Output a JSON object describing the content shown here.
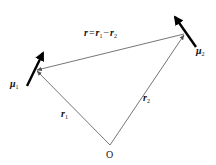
{
  "diagram": {
    "origin": {
      "label": "O",
      "x": 110,
      "y": 145
    },
    "points": {
      "dipole1": {
        "x": 36,
        "y": 70
      },
      "dipole2": {
        "x": 185,
        "y": 33
      }
    },
    "vectors": [
      {
        "id": "r1",
        "label": "r",
        "subscript": "1",
        "from": "O",
        "to": "dipole1"
      },
      {
        "id": "r2",
        "label": "r",
        "subscript": "2",
        "from": "O",
        "to": "dipole2"
      },
      {
        "id": "r",
        "label": "r",
        "from": "dipole2",
        "to": "dipole1"
      }
    ],
    "dipoles": [
      {
        "id": "mu1",
        "label": "μ",
        "subscript": "1"
      },
      {
        "id": "mu2",
        "label": "μ",
        "subscript": "2"
      }
    ],
    "equation": {
      "lhs": "r",
      "eq": "=",
      "t1": "r",
      "t1_sub": "1",
      "minus": "−",
      "t2": "r",
      "t2_sub": "2"
    },
    "colors": {
      "thin_line": "#666666",
      "dipole": "#000000",
      "text": "#111111"
    }
  }
}
